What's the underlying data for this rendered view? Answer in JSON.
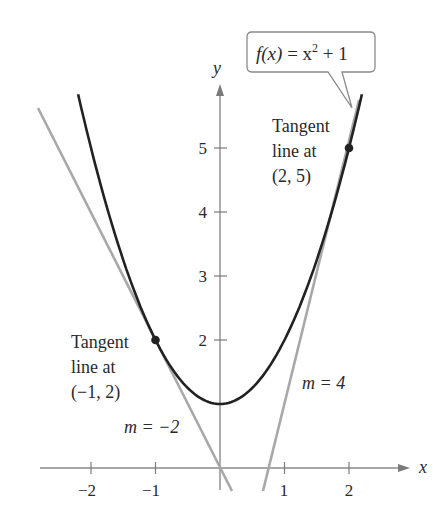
{
  "chart_data": {
    "type": "line",
    "title": "",
    "xlabel": "x",
    "ylabel": "y",
    "xlim": [
      -2.8,
      2.6
    ],
    "ylim": [
      -0.35,
      5.9
    ],
    "x_ticks": [
      -2,
      -1,
      1,
      2
    ],
    "x_tick_labels": [
      "−2",
      "−1",
      "1",
      "2"
    ],
    "y_ticks": [
      2,
      3,
      4,
      5
    ],
    "y_tick_labels": [
      "2",
      "3",
      "4",
      "5"
    ],
    "grid": false,
    "series": [
      {
        "name": "f(x) = x^2 + 1",
        "kind": "curve",
        "x": [
          -2.2,
          -1,
          0,
          1,
          2,
          2.2
        ],
        "y": [
          5.84,
          2,
          1,
          2,
          5,
          5.84
        ],
        "color": "#222222"
      },
      {
        "name": "Tangent line at (-1, 2)",
        "kind": "line",
        "slope": -2,
        "intercept": 0,
        "x": [
          -2.8,
          0.18
        ],
        "color": "#a8a8a8"
      },
      {
        "name": "Tangent line at (2, 5)",
        "kind": "line",
        "slope": 4,
        "intercept": -3,
        "x": [
          0.67,
          2.2
        ],
        "color": "#a8a8a8"
      }
    ],
    "points": [
      {
        "x": -1,
        "y": 2
      },
      {
        "x": 2,
        "y": 5
      }
    ],
    "annotations": [
      {
        "text": "f(x) = x² + 1",
        "type": "callout"
      },
      {
        "text": "Tangent line at (−1, 2)"
      },
      {
        "text": "Tangent line at (2, 5)"
      },
      {
        "text": "m = −2"
      },
      {
        "text": "m = 4"
      }
    ]
  },
  "labels": {
    "callout_fx": "f(x)",
    "callout_eq": " = x",
    "callout_exp": "2",
    "callout_rest": " + 1",
    "axis_x": "x",
    "axis_y": "y",
    "left_tangent": [
      "Tangent",
      "line at",
      "(−1, 2)"
    ],
    "right_tangent": [
      "Tangent",
      "line at",
      "(2, 5)"
    ],
    "slope_left": "m = −2",
    "slope_right": "m = 4",
    "xticks": [
      "−2",
      "−1",
      "1",
      "2"
    ],
    "yticks": [
      "2",
      "3",
      "4",
      "5"
    ]
  }
}
